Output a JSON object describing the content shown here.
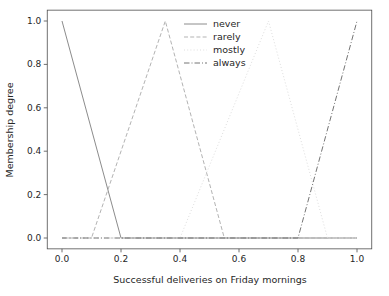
{
  "figure": {
    "background": "#ffffff",
    "spine_color": "#4d4d4d",
    "tick_color": "#4d4d4d",
    "text_color": "#262626"
  },
  "chart_data": {
    "type": "line",
    "title": "",
    "xlabel": "Successful deliveries on Friday mornings",
    "ylabel": "Membership degree",
    "xlim": [
      0,
      1
    ],
    "ylim": [
      0,
      1
    ],
    "grid": false,
    "xticks": {
      "values": [
        0.0,
        0.2,
        0.4,
        0.6,
        0.8,
        1.0
      ],
      "labels": [
        "0.0",
        "0.2",
        "0.4",
        "0.6",
        "0.8",
        "1.0"
      ]
    },
    "yticks": {
      "values": [
        0.0,
        0.2,
        0.4,
        0.6,
        0.8,
        1.0
      ],
      "labels": [
        "0.0",
        "0.2",
        "0.4",
        "0.6",
        "0.8",
        "1.0"
      ]
    },
    "series": [
      {
        "name": "never",
        "style": "solid",
        "color": "#8c8c8c",
        "points": [
          [
            0.0,
            1.0
          ],
          [
            0.2,
            0.0
          ],
          [
            1.0,
            0.0
          ]
        ]
      },
      {
        "name": "rarely",
        "style": "dashed",
        "color": "#b3b3b3",
        "points": [
          [
            0.0,
            0.0
          ],
          [
            0.1,
            0.0
          ],
          [
            0.35,
            1.0
          ],
          [
            0.55,
            0.0
          ],
          [
            1.0,
            0.0
          ]
        ]
      },
      {
        "name": "mostly",
        "style": "dotted",
        "color": "#dedede",
        "points": [
          [
            0.0,
            0.0
          ],
          [
            0.4,
            0.0
          ],
          [
            0.7,
            1.0
          ],
          [
            0.9,
            0.0
          ],
          [
            1.0,
            0.0
          ]
        ]
      },
      {
        "name": "always",
        "style": "dashdot",
        "color": "#757575",
        "points": [
          [
            0.0,
            0.0
          ],
          [
            0.8,
            0.0
          ],
          [
            1.0,
            1.0
          ]
        ]
      }
    ],
    "legend": {
      "position": "upper center",
      "frame": false,
      "entries": [
        "never",
        "rarely",
        "mostly",
        "always"
      ]
    }
  }
}
